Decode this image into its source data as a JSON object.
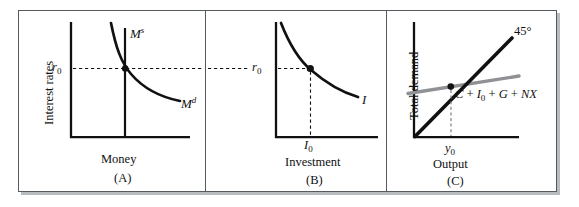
{
  "figure": {
    "background": "#ffffff",
    "frame_color": "#555a5e",
    "ink_color": "#111111",
    "gray_line_color": "#8f9194",
    "width": 579,
    "height": 207
  },
  "panels": [
    {
      "id": "A",
      "letter": "(A)",
      "x_axis_title": "Money",
      "y_axis_title": "Interest rates",
      "curves": [
        {
          "name": "money-supply",
          "label": "M",
          "superscript": "s",
          "style": "vertical-line"
        },
        {
          "name": "money-demand",
          "label": "M",
          "superscript": "d",
          "style": "downward-convex-curve"
        }
      ],
      "tick_y": {
        "label": "r",
        "subscript": "0"
      },
      "equilibrium_marker": true
    },
    {
      "id": "B",
      "letter": "(B)",
      "x_axis_title": "Investment",
      "y_axis_title": "",
      "curves": [
        {
          "name": "investment-schedule",
          "label": "I",
          "superscript": "",
          "style": "downward-convex-curve"
        }
      ],
      "tick_y": {
        "label": "r",
        "subscript": "0"
      },
      "tick_x": {
        "label": "I",
        "subscript": "0"
      },
      "equilibrium_marker": true
    },
    {
      "id": "C",
      "letter": "(C)",
      "x_axis_title": "Output",
      "y_axis_title": "Total demand",
      "curves": [
        {
          "name": "forty-five-degree-line",
          "label": "45°",
          "style": "straight-line-black"
        },
        {
          "name": "aggregate-demand-line",
          "label": "C + I0 + G + NX",
          "style": "straight-line-gray"
        }
      ],
      "tick_x": {
        "label": "y",
        "subscript": "0"
      },
      "equilibrium_marker": true
    }
  ],
  "labels": {
    "money_supply": "M",
    "money_supply_sup": "s",
    "money_demand": "M",
    "money_demand_sup": "d",
    "investment_curve": "I",
    "r_zero": "r",
    "r_zero_sub": "0",
    "i_zero": "I",
    "i_zero_sub": "0",
    "y_zero": "y",
    "y_zero_sub": "0",
    "forty_five": "45°",
    "interest_rates": "Interest rates",
    "total_demand": "Total demand",
    "money": "Money",
    "investment": "Investment",
    "output": "Output",
    "panel_a": "(A)",
    "panel_b": "(B)",
    "panel_c": "(C)",
    "ad_c": "C",
    "ad_plus1": " + ",
    "ad_i": "I",
    "ad_i_sub": "0",
    "ad_plus2": " + ",
    "ad_g": "G",
    "ad_plus3": " + ",
    "ad_nx": "NX"
  }
}
